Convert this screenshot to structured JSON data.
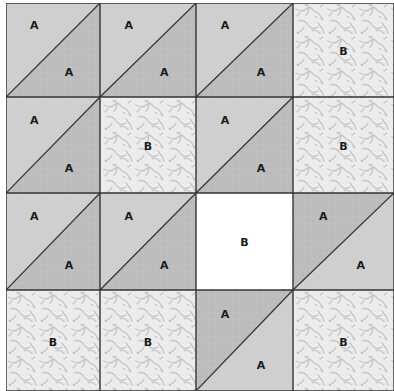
{
  "diagram": {
    "grid": {
      "rows": 4,
      "cols": 4
    },
    "colors": {
      "light_triangle": "#cfcfcf",
      "dark_triangle": "#bdbdbd",
      "print_background": "#ececec",
      "print_motif": "#c4c4c4",
      "plain_white": "#ffffff",
      "line": "#333333"
    },
    "cells": [
      [
        {
          "type": "hst",
          "shade": "light-upper",
          "labels": [
            "A",
            "A"
          ]
        },
        {
          "type": "hst",
          "shade": "light-upper",
          "labels": [
            "A",
            "A"
          ]
        },
        {
          "type": "hst",
          "shade": "light-upper",
          "labels": [
            "A",
            "A"
          ]
        },
        {
          "type": "print",
          "labels": [
            "B"
          ]
        }
      ],
      [
        {
          "type": "hst",
          "shade": "light-upper",
          "labels": [
            "A",
            "A"
          ]
        },
        {
          "type": "print",
          "labels": [
            "B"
          ]
        },
        {
          "type": "hst",
          "shade": "light-upper",
          "labels": [
            "A",
            "A"
          ]
        },
        {
          "type": "print",
          "labels": [
            "B"
          ]
        }
      ],
      [
        {
          "type": "hst",
          "shade": "light-upper",
          "labels": [
            "A",
            "A"
          ]
        },
        {
          "type": "hst",
          "shade": "light-upper",
          "labels": [
            "A",
            "A"
          ]
        },
        {
          "type": "plain",
          "labels": [
            "B"
          ]
        },
        {
          "type": "hst",
          "shade": "dark-upper",
          "labels": [
            "A",
            "A"
          ]
        }
      ],
      [
        {
          "type": "print",
          "labels": [
            "B"
          ]
        },
        {
          "type": "print",
          "labels": [
            "B"
          ]
        },
        {
          "type": "hst",
          "shade": "dark-upper",
          "labels": [
            "A",
            "A"
          ]
        },
        {
          "type": "print",
          "labels": [
            "B"
          ]
        }
      ]
    ]
  }
}
